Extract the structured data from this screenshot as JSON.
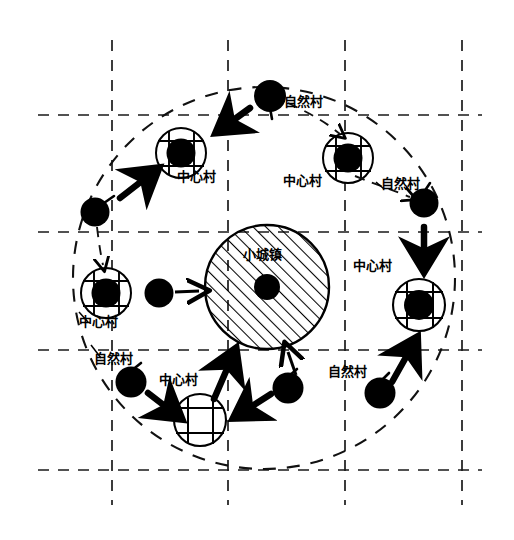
{
  "diagram": {
    "title_text_present": false,
    "colors": {
      "stroke": "#000000",
      "fill_node": "#000000",
      "background": "#ffffff",
      "grid": "#333333"
    },
    "canvas": {
      "width": 514,
      "height": 540
    },
    "grid": {
      "vertical_x": [
        112,
        228,
        345,
        462
      ],
      "horizontal_y": [
        115,
        232,
        350,
        470
      ],
      "v_extent": [
        40,
        505
      ],
      "h_extent": [
        38,
        482
      ],
      "style": "dashed"
    },
    "service_area_circle": {
      "cx": 264,
      "cy": 278,
      "r": 191,
      "style": "dashed",
      "label": ""
    },
    "town": {
      "label": "小城镇",
      "cx": 267,
      "cy": 287,
      "r": 62,
      "hatch": "diagonal",
      "core_dot_r": 13,
      "label_x": 243,
      "label_y": 247
    },
    "legend_terms": {
      "town": "小城镇",
      "central_village": "中心村",
      "natural_village": "自然村"
    },
    "central_villages": [
      {
        "id": "cv-top-left",
        "label": "中心村",
        "cx": 181,
        "cy": 153,
        "r": 25,
        "has_core": true,
        "label_x": 177,
        "label_y": 176
      },
      {
        "id": "cv-top-right",
        "label": "中心村",
        "cx": 348,
        "cy": 158,
        "r": 25,
        "has_core": true,
        "label_x": 283,
        "label_y": 180
      },
      {
        "id": "cv-left",
        "label": "中心村",
        "cx": 106,
        "cy": 293,
        "r": 25,
        "has_core": true,
        "label_x": 78,
        "label_y": 320
      },
      {
        "id": "cv-right",
        "label": "中心村",
        "cx": 419,
        "cy": 305,
        "r": 25,
        "has_core": true,
        "label_x": 353,
        "label_y": 266
      },
      {
        "id": "cv-bottom",
        "label": "中心村",
        "cx": 200,
        "cy": 420,
        "r": 25,
        "has_core": false,
        "label_x": 160,
        "label_y": 379
      }
    ],
    "natural_villages": [
      {
        "id": "nv-top",
        "label": "自然村",
        "cx": 270,
        "cy": 96,
        "r": 15,
        "label_x": 284,
        "label_y": 102
      },
      {
        "id": "nv-upper-left",
        "label": "",
        "cx": 95,
        "cy": 212,
        "r": 14,
        "label_x": 0,
        "label_y": 0
      },
      {
        "id": "nv-upper-right",
        "label": "自然村",
        "cx": 424,
        "cy": 203,
        "r": 14,
        "label_x": 379,
        "label_y": 184
      },
      {
        "id": "nv-mid-left",
        "label": "",
        "cx": 159,
        "cy": 293,
        "r": 14,
        "label_x": 0,
        "label_y": 0
      },
      {
        "id": "nv-lower-left",
        "label": "自然村",
        "cx": 131,
        "cy": 382,
        "r": 15,
        "label_x": 94,
        "label_y": 358
      },
      {
        "id": "nv-bottom-mid",
        "label": "",
        "cx": 288,
        "cy": 388,
        "r": 15,
        "label_x": 0,
        "label_y": 0
      },
      {
        "id": "nv-bottom-right",
        "label": "自然村",
        "cx": 380,
        "cy": 393,
        "r": 15,
        "label_x": 328,
        "label_y": 371
      }
    ],
    "flow_arrows": [
      {
        "id": "arrow-nv-top-to-cv-top-left",
        "from": "nv-top",
        "to": "cv-top-left",
        "weight": "heavy"
      },
      {
        "id": "arrow-nv-top-to-cv-top-right",
        "from": "nv-top",
        "to": "cv-top-right",
        "weight": "light"
      },
      {
        "id": "arrow-nv-upper-left-to-cv-topleft",
        "from": "nv-upper-left",
        "to": "cv-top-left",
        "weight": "heavy"
      },
      {
        "id": "arrow-nv-upper-left-to-cv-left",
        "from": "nv-upper-left",
        "to": "cv-left",
        "weight": "light"
      },
      {
        "id": "arrow-nv-upper-right-to-cv-right",
        "from": "nv-upper-right",
        "to": "cv-right",
        "weight": "heavy"
      },
      {
        "id": "arrow-cv-top-right-to-nv-ur",
        "from": "cv-top-right",
        "to": "nv-upper-right",
        "weight": "light"
      },
      {
        "id": "arrow-nv-mid-left-to-town",
        "from": "nv-mid-left",
        "to": "town",
        "weight": "light"
      },
      {
        "id": "arrow-cv-bottom-to-town",
        "from": "cv-bottom",
        "to": "town",
        "weight": "heavy"
      },
      {
        "id": "arrow-nv-bottom-mid-to-town",
        "from": "nv-bottom-mid",
        "to": "town",
        "weight": "light"
      },
      {
        "id": "arrow-nv-bottom-mid-to-cv-bottom",
        "from": "nv-bottom-mid",
        "to": "cv-bottom",
        "weight": "heavy"
      },
      {
        "id": "arrow-nv-lower-left-to-cv-bottom",
        "from": "nv-lower-left",
        "to": "cv-bottom",
        "weight": "heavy"
      },
      {
        "id": "arrow-nv-bottom-right-to-cv-right",
        "from": "nv-bottom-right",
        "to": "cv-right",
        "weight": "heavy"
      }
    ]
  }
}
